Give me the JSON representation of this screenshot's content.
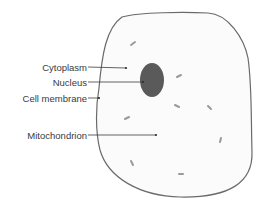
{
  "diagram": {
    "colors": {
      "background": "#ffffff",
      "cell_fill": "#fbfbfb",
      "cell_outline": "#6a6a6a",
      "nucleus_fill": "#5a5a5a",
      "label_text": "#3a3a3a",
      "leader_line": "#3c3c3c",
      "mitochondria": "#9a9a9a"
    },
    "labels": [
      {
        "id": "cytoplasm",
        "text": "Cytoplasm",
        "anchor_x": 87,
        "anchor_y": 67,
        "target_x": 126,
        "target_y": 68
      },
      {
        "id": "nucleus",
        "text": "Nucleus",
        "anchor_x": 87,
        "anchor_y": 82,
        "target_x": 143,
        "target_y": 82
      },
      {
        "id": "cell-membrane",
        "text": "Cell membrane",
        "anchor_x": 87,
        "anchor_y": 98,
        "target_x": 99,
        "target_y": 98
      },
      {
        "id": "mitochondrion",
        "text": "Mitochondrion",
        "anchor_x": 87,
        "anchor_y": 135,
        "target_x": 156,
        "target_y": 135
      }
    ],
    "nucleus": {
      "cx": 152,
      "cy": 80,
      "rx": 12,
      "ry": 17
    },
    "mitochondria": [
      {
        "x1": 131,
        "y1": 45,
        "x2": 135,
        "y2": 42
      },
      {
        "x1": 177,
        "y1": 77,
        "x2": 181,
        "y2": 75
      },
      {
        "x1": 175,
        "y1": 105,
        "x2": 179,
        "y2": 107
      },
      {
        "x1": 208,
        "y1": 106,
        "x2": 211,
        "y2": 109
      },
      {
        "x1": 125,
        "y1": 119,
        "x2": 129,
        "y2": 117
      },
      {
        "x1": 221,
        "y1": 138,
        "x2": 220,
        "y2": 142
      },
      {
        "x1": 131,
        "y1": 161,
        "x2": 133,
        "y2": 165
      },
      {
        "x1": 179,
        "y1": 174,
        "x2": 183,
        "y2": 174
      }
    ]
  }
}
